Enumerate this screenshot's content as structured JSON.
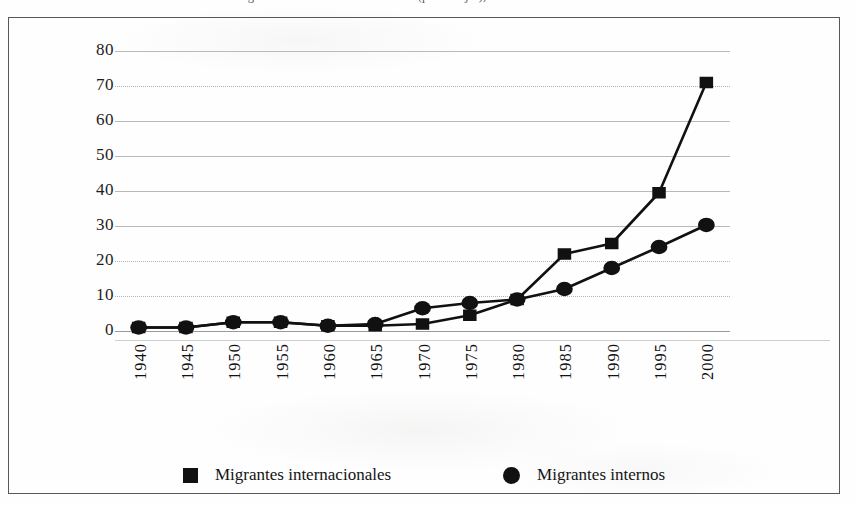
{
  "figure": {
    "caption_top": "Gráfica 1. Migrantes internos e internacionales (porcentajes), 1940-2000"
  },
  "legend": {
    "position": "bottom",
    "entries": [
      {
        "marker": "square-marker-icon",
        "label": "Migrantes internacionales",
        "color": "#111111"
      },
      {
        "marker": "circle-marker-icon",
        "label": "Migrantes internos",
        "color": "#111111"
      }
    ]
  },
  "axes": {
    "y_ticks": [
      "80",
      "70",
      "60",
      "50",
      "40",
      "30",
      "20",
      "10",
      "0"
    ],
    "x_ticks": [
      "1940",
      "1945",
      "1950",
      "1955",
      "1960",
      "1965",
      "1970",
      "1975",
      "1980",
      "1985",
      "1990",
      "1995",
      "2000"
    ]
  },
  "chart_data": {
    "type": "line",
    "title": "",
    "xlabel": "",
    "ylabel": "",
    "ylim": [
      0,
      80
    ],
    "ytick_step": 10,
    "grid": true,
    "legend_position": "bottom",
    "categories": [
      "1940",
      "1945",
      "1950",
      "1955",
      "1960",
      "1965",
      "1970",
      "1975",
      "1980",
      "1985",
      "1990",
      "1995",
      "2000"
    ],
    "series": [
      {
        "name": "Migrantes internacionales",
        "marker": "square",
        "color": "#111111",
        "values": [
          1,
          1,
          2.5,
          2.5,
          1.5,
          1.5,
          2,
          4.5,
          9,
          22,
          25,
          39.5,
          71
        ]
      },
      {
        "name": "Migrantes internos",
        "marker": "circle",
        "color": "#111111",
        "values": [
          1,
          1,
          2.5,
          2.5,
          1.5,
          2,
          6.5,
          8,
          9,
          12,
          18,
          24,
          30.3
        ]
      }
    ]
  }
}
